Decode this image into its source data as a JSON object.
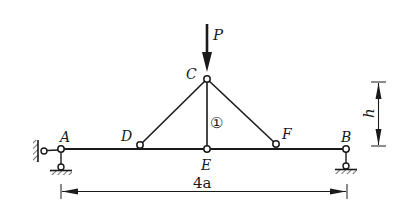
{
  "diagram": {
    "type": "truss-beam structure",
    "colors": {
      "ink": "#1a1a1a",
      "background": "#ffffff"
    },
    "nodes": {
      "A": {
        "label": "A",
        "x": 61,
        "y": 149
      },
      "B": {
        "label": "B",
        "x": 346,
        "y": 149
      },
      "C": {
        "label": "C",
        "x": 207,
        "y": 79
      },
      "D": {
        "label": "D",
        "x": 140,
        "y": 145
      },
      "E": {
        "label": "E",
        "x": 207,
        "y": 149
      },
      "F": {
        "label": "F",
        "x": 276,
        "y": 144
      }
    },
    "members": [
      {
        "from": "A",
        "to": "B",
        "kind": "beam"
      },
      {
        "from": "C",
        "to": "D",
        "kind": "bar"
      },
      {
        "from": "C",
        "to": "E",
        "kind": "bar",
        "label": "①"
      },
      {
        "from": "C",
        "to": "F",
        "kind": "bar"
      }
    ],
    "member_label": "①",
    "load": {
      "label": "P",
      "at": "C",
      "direction": "down"
    },
    "supports": {
      "A": "fixed hinge (horizontal link to wall + vertical link to ground)",
      "B": "roller (vertical link to ground)"
    },
    "dimensions": {
      "span": {
        "label": "4a",
        "from": "A",
        "to": "B"
      },
      "height": {
        "label": "h",
        "from": "beam",
        "to": "C"
      }
    }
  }
}
